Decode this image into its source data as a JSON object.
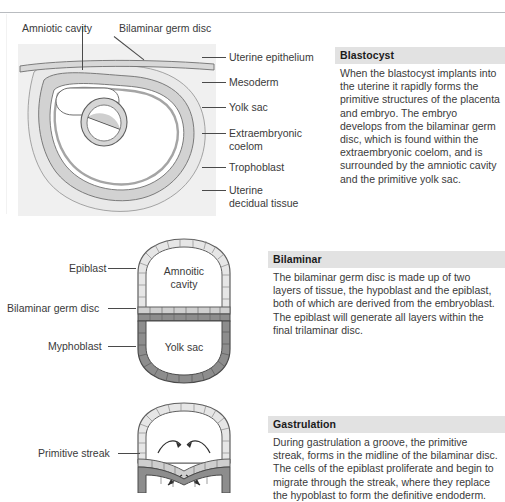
{
  "figures": [
    {
      "id": "blastocyst",
      "title_labels": [
        {
          "name": "amniotic-cavity",
          "text": "Amniotic cavity"
        },
        {
          "name": "bilaminar-germ-disc",
          "text": "Bilaminar germ disc"
        }
      ],
      "right_labels": [
        {
          "name": "uterine-epithelium",
          "text": "Uterine epithelium"
        },
        {
          "name": "mesoderm",
          "text": "Mesoderm"
        },
        {
          "name": "yolk-sac",
          "text": "Yolk sac"
        },
        {
          "name": "extraembryonic-coelom",
          "text": "Extraembryonic coelom"
        },
        {
          "name": "trophoblast",
          "text": "Trophoblast"
        },
        {
          "name": "uterine-decidual-tissue",
          "text": "Uterine decidual tissue"
        }
      ]
    },
    {
      "id": "bilaminar",
      "left_labels": [
        {
          "name": "epiblast",
          "text": "Epiblast"
        },
        {
          "name": "bilaminar-germ-disc",
          "text": "Bilaminar germ disc"
        },
        {
          "name": "myphoblast",
          "text": "Myphoblast"
        }
      ],
      "inner_labels": [
        {
          "name": "amniotic-cavity",
          "line1": "Amnoitic",
          "line2": "cavity"
        },
        {
          "name": "yolk-sac",
          "line1": "Yolk sac",
          "line2": ""
        }
      ]
    },
    {
      "id": "gastrulation",
      "left_labels": [
        {
          "name": "primitive-streak",
          "text": "Primitive streak"
        }
      ]
    }
  ],
  "panels": [
    {
      "id": "blastocyst",
      "heading": "Blastocyst",
      "body": "When the blastocyst implants into the uterine it rapidly forms the primitive structures of the placenta and embryo. The embryo develops from the bilaminar germ disc, which is found within the extraembryonic coelom, and is surrounded by the amniotic cavity and the primitive yolk sac."
    },
    {
      "id": "bilaminar",
      "heading": "Bilaminar",
      "body": "The bilaminar germ disc is made up of two layers of tissue, the hypoblast and the epiblast, both of which are derived from the embryoblast. The epiblast will generate all layers within the final trilaminar disc."
    },
    {
      "id": "gastrulation",
      "heading": "Gastrulation",
      "body": "During gastrulation a groove, the primitive streak, forms in the midline of the bilaminar disc. The cells of the epiblast proliferate and begin to migrate through the streak, where they replace the hypoblast to form the definitive endoderm."
    }
  ],
  "colors": {
    "panel_header_bg": "#e2e2e2",
    "figure_bg": "#f0f0f0",
    "epiblast_fill": "#e6e6e6",
    "hypoblast_fill": "#8d8d8d",
    "mesoderm_fill": "#b4b4b4",
    "coelom_fill": "#ffffff",
    "decidua_fill": "#e3e3e3",
    "stroke": "#4a4a4a",
    "text": "#3a3a3a"
  }
}
